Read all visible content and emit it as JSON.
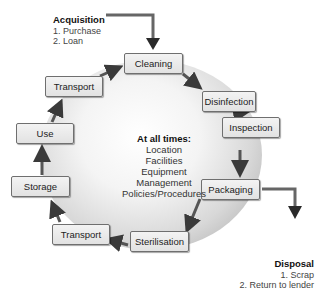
{
  "acquisition": {
    "title": "Acquisition",
    "items": [
      "1. Purchase",
      "2. Loan"
    ]
  },
  "disposal": {
    "title": "Disposal",
    "items": [
      "1. Scrap",
      "2. Return to lender"
    ]
  },
  "center": {
    "title": "At all times:",
    "items": [
      "Location",
      "Facilities",
      "Equipment",
      "Management",
      "Policies/Procedures"
    ]
  },
  "steps": [
    {
      "label": "Cleaning"
    },
    {
      "label": "Disinfection"
    },
    {
      "label": "Inspection"
    },
    {
      "label": "Packaging"
    },
    {
      "label": "Sterilisation"
    },
    {
      "label": "Transport"
    },
    {
      "label": "Storage"
    },
    {
      "label": "Use"
    },
    {
      "label": "Transport"
    }
  ],
  "colors": {
    "arrow": "#444444",
    "box_border": "#6f6f6f",
    "box_fill": "#ececec"
  }
}
